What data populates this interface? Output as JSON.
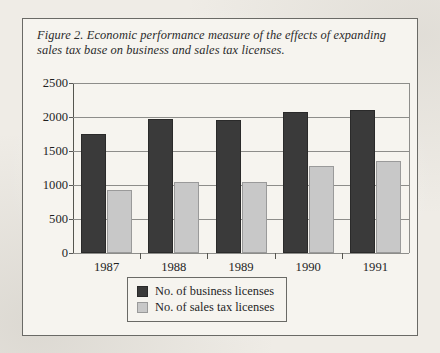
{
  "figure": {
    "caption": "Figure 2. Economic performance measure of the effects of expanding sales tax base on business and sales tax licenses."
  },
  "colors": {
    "business_bar": "#3a3a3a",
    "sales_tax_bar": "#c8c8c8",
    "axis": "#55554f",
    "gridline": "#8d8d8a",
    "paper": "#f6f4ef",
    "page": "#efece6"
  },
  "legend": {
    "position": "below-axis-center",
    "entries": [
      {
        "label": "No. of business licenses",
        "swatch": "business"
      },
      {
        "label": "No. of sales tax licenses",
        "swatch": "salestax"
      }
    ]
  },
  "chart_data": {
    "type": "bar",
    "title": "Figure 2. Economic performance measure of the effects of expanding sales tax base on business and sales tax licenses.",
    "xlabel": "",
    "ylabel": "",
    "categories": [
      "1987",
      "1988",
      "1989",
      "1990",
      "1991"
    ],
    "series": [
      {
        "name": "No. of business licenses",
        "color": "#3a3a3a",
        "values": [
          1750,
          1970,
          1960,
          2070,
          2110
        ]
      },
      {
        "name": "No. of sales tax licenses",
        "color": "#c8c8c8",
        "values": [
          930,
          1050,
          1050,
          1280,
          1360
        ]
      }
    ],
    "ylim": [
      0,
      2500
    ],
    "yticks": [
      0,
      500,
      1000,
      1500,
      2000,
      2500
    ],
    "ytick_labels": [
      "0",
      "500",
      "1000",
      "1500",
      "2000",
      "2500"
    ],
    "grid": true,
    "legend_position": "bottom"
  }
}
